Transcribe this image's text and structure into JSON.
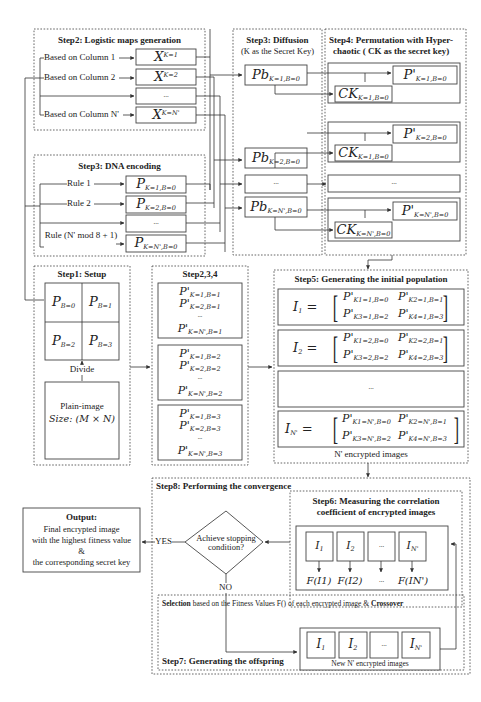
{
  "step2_logistic": {
    "title": "Step2: Logistic maps generation",
    "rows": [
      {
        "label": "Based on Column 1",
        "var": "X",
        "sup": "K=1"
      },
      {
        "label": "Based on Column 2",
        "var": "X",
        "sup": "K=2"
      },
      {
        "label": "",
        "var": "...",
        "sup": ""
      },
      {
        "label": "Based on Column N'",
        "var": "X",
        "sup": "K=N'"
      }
    ]
  },
  "step3_dna": {
    "title": "Step3: DNA encoding",
    "rows": [
      {
        "label": "Rule 1",
        "var": "P",
        "sub": "K=1,B=0"
      },
      {
        "label": "Rule 2",
        "var": "P",
        "sub": "K=2,B=0"
      },
      {
        "label": "",
        "var": "...",
        "sub": ""
      },
      {
        "label": "Rule (N' mod 8 + 1)",
        "var": "P",
        "sub": "K=N',B=0"
      }
    ]
  },
  "step3_diffusion": {
    "title": "Step3: Diffusion",
    "subtitle": "(K as the Secret Key)",
    "items": [
      {
        "var": "Pb",
        "sub": "K=1,B=0"
      },
      {
        "var": "Pb",
        "sub": "K=2,B=0"
      },
      {
        "var": "...",
        "sub": ""
      },
      {
        "var": "Pb",
        "sub": "K=N',B=0"
      }
    ]
  },
  "step4_permutation": {
    "title": "Step4: Permutation with Hyper-",
    "subtitle": "chaotic ( CK as the secret key)",
    "groups": [
      {
        "p": "P'",
        "p_sub": "K=1,B=0",
        "ck": "CK",
        "ck_sub": "K=1,B=0"
      },
      {
        "p": "P'",
        "p_sub": "K=2,B=0",
        "ck": "CK",
        "ck_sub": "K=1,B=0"
      },
      {
        "p": "...",
        "p_sub": "",
        "ck": "",
        "ck_sub": ""
      },
      {
        "p": "P'",
        "p_sub": "K=N',B=0",
        "ck": "CK",
        "ck_sub": "K=N',B=0"
      }
    ]
  },
  "step1_setup": {
    "title": "Step1: Setup",
    "blocks": [
      {
        "var": "P",
        "sub": "B=0"
      },
      {
        "var": "P",
        "sub": "B=1"
      },
      {
        "var": "P",
        "sub": "B=2"
      },
      {
        "var": "P",
        "sub": "B=3"
      }
    ],
    "divide_label": "Divide",
    "plain_image_label": "Plain-image",
    "size_label": "Size: (M × N)"
  },
  "step234": {
    "title": "Step2,3,4",
    "groups": [
      {
        "lines": [
          "K=1,B=1",
          "K=2,B=1",
          "...",
          "K=N',B=1"
        ]
      },
      {
        "lines": [
          "K=1,B=2",
          "K=2,B=2",
          "...",
          "K=N',B=2"
        ]
      },
      {
        "lines": [
          "K=1,B=3",
          "K=2,B=3",
          "...",
          "K=N',B=3"
        ]
      }
    ]
  },
  "step5_population": {
    "title": "Step5: Generating the initial population",
    "individuals": [
      {
        "name": "I",
        "name_sub": "1",
        "m": [
          "K1=1,B=0",
          "K2=1,B=1",
          "K3=1,B=2",
          "K4=1,B=3"
        ]
      },
      {
        "name": "I",
        "name_sub": "2",
        "m": [
          "K1=2,B=0",
          "K2=2,B=1",
          "K3=2,B=2",
          "K4=2,B=3"
        ]
      },
      {
        "name": "...",
        "name_sub": "",
        "m": []
      },
      {
        "name": "I",
        "name_sub": "N'",
        "m": [
          "K1=N',B=0",
          "K2=N',B=1",
          "K3=N',B=2",
          "K4=N',B=3"
        ]
      }
    ],
    "footer": "N' encrypted images"
  },
  "step8_convergence": {
    "title": "Step8: Performing the convergence",
    "decision": "Achieve stopping condition?",
    "yes_label": "YES",
    "no_label": "NO"
  },
  "step6_measure": {
    "title_line1": "Step6: Measuring the correlation",
    "title_line2": "coefficient of encrypted images",
    "images": [
      {
        "name": "I",
        "sub": "1",
        "f": "F(I1)"
      },
      {
        "name": "I",
        "sub": "2",
        "f": "F(I2)"
      },
      {
        "name": "...",
        "sub": "",
        "f": "..."
      },
      {
        "name": "I",
        "sub": "N'",
        "f": "F(IN')"
      }
    ]
  },
  "step7_offspring": {
    "selection_bold": "Selection",
    "selection_text": "based on the Fitness Values F() of each encrypted image &",
    "crossover_bold": "Crossover",
    "title": "Step7: Generating the offspring",
    "images": [
      {
        "name": "I",
        "sub": "1"
      },
      {
        "name": "I",
        "sub": "2"
      },
      {
        "name": "...",
        "sub": ""
      },
      {
        "name": "I",
        "sub": "N'"
      }
    ],
    "footer": "New N' encrypted images"
  },
  "output": {
    "title": "Output:",
    "lines": [
      "Final encrypted image",
      "with the highest fitness value",
      "&",
      "the corresponding secret key"
    ]
  }
}
